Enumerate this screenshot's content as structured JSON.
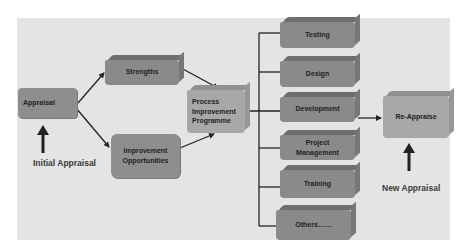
{
  "diagram": {
    "nodes": {
      "appraisal": "Appraisal",
      "strengths": "Strengths",
      "improvement_line1": "Improvement",
      "improvement_line2": "Opportunities",
      "process_line1": "Process",
      "process_line2": "Improvement",
      "process_line3": "Programme",
      "testing": "Testing",
      "design": "Design",
      "development": "Development",
      "project_mgmt_line1": "Project",
      "project_mgmt_line2": "Management",
      "training": "Training",
      "others": "Others……",
      "reappraise": "Re-Appraise"
    },
    "labels": {
      "initial_appraisal": "Initial Appraisal",
      "new_appraisal": "New Appraisal"
    },
    "colors": {
      "panel_background": "#e4e4e4",
      "box_fill": "#8a8a8a",
      "box_top": "#6e6e6e",
      "light_box_fill": "#a8a8a8",
      "line": "#222222"
    }
  }
}
